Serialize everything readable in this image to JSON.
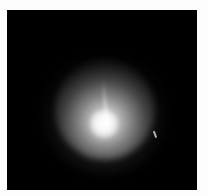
{
  "image": {
    "description": "Grayscale image of a diffuse glowing nebulous object (comet-like coma) on a black background",
    "colors": {
      "background": "#000000",
      "border": "#fdfdfd",
      "glow": "#ffffff"
    },
    "features": [
      {
        "name": "bright-core",
        "position": "lower-center"
      },
      {
        "name": "diffuse-halo",
        "position": "center"
      },
      {
        "name": "faint-ray",
        "position": "above core"
      },
      {
        "name": "small-streak",
        "position": "right of halo"
      }
    ]
  }
}
